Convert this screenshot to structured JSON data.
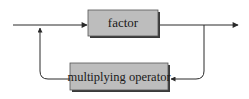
{
  "diagram": {
    "type": "syntax-railroad",
    "nodes": [
      {
        "id": "factor",
        "label": "factor"
      },
      {
        "id": "multiplying_operator",
        "label": "multiplying operator"
      }
    ],
    "edges": [
      {
        "from": "entry",
        "to": "factor"
      },
      {
        "from": "factor",
        "to": "exit"
      },
      {
        "from": "factor",
        "to": "multiplying_operator",
        "note": "loop back"
      },
      {
        "from": "multiplying_operator",
        "to": "factor",
        "note": "repeat"
      }
    ],
    "colors": {
      "box_fill": "#bdbdbd",
      "box_shadow": "#3a3a3a",
      "line": "#2a2a2a",
      "background": "#ffffff"
    }
  }
}
